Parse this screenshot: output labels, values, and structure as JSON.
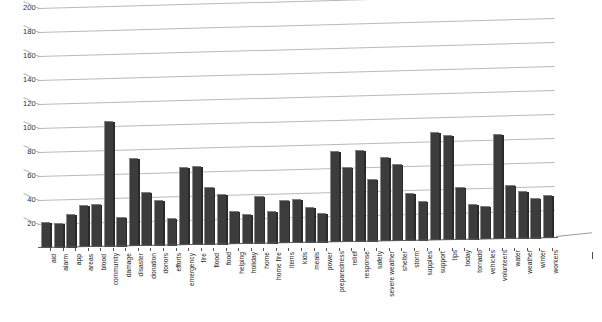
{
  "chart_data": {
    "type": "bar",
    "title": "",
    "subtitle": "",
    "xlabel": "",
    "ylabel": "",
    "ylim": [
      0,
      200
    ],
    "ytick_step": 20,
    "yticks": [
      200,
      180,
      160,
      140,
      120,
      100,
      80,
      60,
      40,
      20
    ],
    "grid": true,
    "legend": false,
    "legend_position": "none",
    "orientation": "vertical",
    "style": "3d-perspective",
    "bar_color": "#3c3c3c",
    "grid_color": "#b9b9b9",
    "categories": [
      "aid",
      "alarm",
      "app",
      "areas",
      "blood",
      "community",
      "damage",
      "disaster",
      "donation",
      "donors",
      "efforts",
      "emergency",
      "fire",
      "flood",
      "food",
      "helping",
      "holiday",
      "home",
      "home fire",
      "items",
      "kids",
      "meals",
      "power",
      "preparedness",
      "relief",
      "response",
      "safety",
      "severe weather",
      "shelter",
      "storm",
      "supplies",
      "support",
      "tips",
      "today",
      "tornado",
      "vehicles",
      "volunteers",
      "water",
      "weather",
      "winter",
      "workers"
    ],
    "values": [
      22,
      21,
      28,
      35,
      36,
      105,
      25,
      74,
      45,
      38,
      23,
      65,
      66,
      48,
      42,
      28,
      25,
      40,
      27,
      36,
      37,
      30,
      25,
      76,
      63,
      77,
      52,
      70,
      64,
      40,
      33,
      90,
      88,
      44,
      30,
      28,
      88,
      45,
      40,
      34,
      36
    ]
  }
}
